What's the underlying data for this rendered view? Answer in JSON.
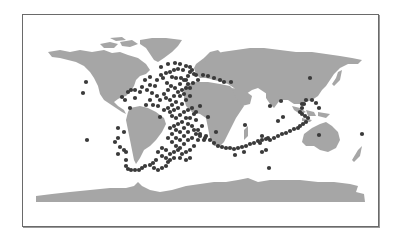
{
  "map": {
    "projection": "equirectangular",
    "colors": {
      "land": "#a6a6a6",
      "dot": "#3a3a3a",
      "frame": "#6a6a6a",
      "background": "#ffffff"
    },
    "marker": {
      "shape": "circle",
      "radius": 2.1
    },
    "points": [
      [
        86,
        82
      ],
      [
        83,
        93
      ],
      [
        87,
        140
      ],
      [
        150,
        77
      ],
      [
        161,
        67
      ],
      [
        168,
        64
      ],
      [
        175,
        63
      ],
      [
        180,
        64
      ],
      [
        183,
        70
      ],
      [
        192,
        70
      ],
      [
        196,
        75
      ],
      [
        198,
        80
      ],
      [
        145,
        80
      ],
      [
        150,
        85
      ],
      [
        155,
        86
      ],
      [
        157,
        80
      ],
      [
        161,
        75
      ],
      [
        166,
        73
      ],
      [
        170,
        72
      ],
      [
        174,
        70
      ],
      [
        178,
        69
      ],
      [
        186,
        66
      ],
      [
        190,
        67
      ],
      [
        194,
        74
      ],
      [
        163,
        78
      ],
      [
        167,
        83
      ],
      [
        171,
        86
      ],
      [
        175,
        88
      ],
      [
        180,
        84
      ],
      [
        184,
        80
      ],
      [
        188,
        76
      ],
      [
        190,
        72
      ],
      [
        186,
        80
      ],
      [
        181,
        78
      ],
      [
        176,
        78
      ],
      [
        172,
        77
      ],
      [
        168,
        90
      ],
      [
        164,
        94
      ],
      [
        166,
        98
      ],
      [
        170,
        100
      ],
      [
        174,
        96
      ],
      [
        178,
        92
      ],
      [
        182,
        90
      ],
      [
        186,
        88
      ],
      [
        188,
        84
      ],
      [
        180,
        96
      ],
      [
        176,
        102
      ],
      [
        172,
        105
      ],
      [
        168,
        108
      ],
      [
        170,
        112
      ],
      [
        174,
        110
      ],
      [
        178,
        108
      ],
      [
        182,
        104
      ],
      [
        186,
        100
      ],
      [
        190,
        96
      ],
      [
        184,
        94
      ],
      [
        190,
        88
      ],
      [
        193,
        83
      ],
      [
        172,
        116
      ],
      [
        176,
        118
      ],
      [
        180,
        115
      ],
      [
        184,
        112
      ],
      [
        188,
        110
      ],
      [
        192,
        108
      ],
      [
        186,
        118
      ],
      [
        182,
        122
      ],
      [
        178,
        124
      ],
      [
        174,
        126
      ],
      [
        170,
        128
      ],
      [
        176,
        130
      ],
      [
        180,
        132
      ],
      [
        184,
        128
      ],
      [
        188,
        124
      ],
      [
        190,
        118
      ],
      [
        194,
        114
      ],
      [
        196,
        120
      ],
      [
        192,
        126
      ],
      [
        188,
        132
      ],
      [
        184,
        136
      ],
      [
        180,
        140
      ],
      [
        176,
        138
      ],
      [
        172,
        134
      ],
      [
        168,
        138
      ],
      [
        172,
        142
      ],
      [
        176,
        146
      ],
      [
        180,
        148
      ],
      [
        184,
        144
      ],
      [
        188,
        140
      ],
      [
        192,
        138
      ],
      [
        196,
        134
      ],
      [
        198,
        140
      ],
      [
        194,
        146
      ],
      [
        190,
        150
      ],
      [
        186,
        152
      ],
      [
        182,
        154
      ],
      [
        178,
        150
      ],
      [
        174,
        152
      ],
      [
        170,
        154
      ],
      [
        166,
        150
      ],
      [
        162,
        148
      ],
      [
        158,
        152
      ],
      [
        162,
        156
      ],
      [
        166,
        158
      ],
      [
        170,
        160
      ],
      [
        174,
        158
      ],
      [
        168,
        162
      ],
      [
        166,
        166
      ],
      [
        162,
        168
      ],
      [
        158,
        170
      ],
      [
        154,
        168
      ],
      [
        190,
        158
      ],
      [
        186,
        160
      ],
      [
        180,
        158
      ],
      [
        194,
        130
      ],
      [
        198,
        130
      ],
      [
        200,
        134
      ],
      [
        204,
        140
      ],
      [
        206,
        136
      ],
      [
        202,
        126
      ],
      [
        196,
        112
      ],
      [
        200,
        106
      ],
      [
        128,
        92
      ],
      [
        131,
        90
      ],
      [
        135,
        90
      ],
      [
        140,
        92
      ],
      [
        142,
        87
      ],
      [
        147,
        90
      ],
      [
        152,
        93
      ],
      [
        157,
        96
      ],
      [
        160,
        100
      ],
      [
        150,
        100
      ],
      [
        153,
        105
      ],
      [
        146,
        105
      ],
      [
        135,
        98
      ],
      [
        125,
        100
      ],
      [
        122,
        97
      ],
      [
        130,
        108
      ],
      [
        164,
        110
      ],
      [
        158,
        106
      ],
      [
        160,
        117
      ],
      [
        118,
        128
      ],
      [
        124,
        132
      ],
      [
        118,
        138
      ],
      [
        115,
        142
      ],
      [
        120,
        147
      ],
      [
        124,
        150
      ],
      [
        118,
        154
      ],
      [
        126,
        152
      ],
      [
        126,
        160
      ],
      [
        126,
        166
      ],
      [
        128,
        169
      ],
      [
        131,
        170
      ],
      [
        135,
        170
      ],
      [
        139,
        170
      ],
      [
        142,
        168
      ],
      [
        145,
        166
      ],
      [
        150,
        165
      ],
      [
        153,
        163
      ],
      [
        156,
        160
      ],
      [
        200,
        136
      ],
      [
        205,
        138
      ],
      [
        210,
        140
      ],
      [
        214,
        143
      ],
      [
        218,
        146
      ],
      [
        222,
        147
      ],
      [
        226,
        148
      ],
      [
        230,
        148
      ],
      [
        234,
        149
      ],
      [
        238,
        148
      ],
      [
        242,
        147
      ],
      [
        246,
        146
      ],
      [
        250,
        144
      ],
      [
        254,
        143
      ],
      [
        258,
        141
      ],
      [
        262,
        140
      ],
      [
        266,
        139
      ],
      [
        270,
        140
      ],
      [
        274,
        138
      ],
      [
        278,
        136
      ],
      [
        282,
        134
      ],
      [
        286,
        133
      ],
      [
        290,
        131
      ],
      [
        294,
        129
      ],
      [
        298,
        128
      ],
      [
        300,
        126
      ],
      [
        303,
        124
      ],
      [
        306,
        122
      ],
      [
        308,
        118
      ],
      [
        305,
        116
      ],
      [
        302,
        114
      ],
      [
        300,
        112
      ],
      [
        302,
        108
      ],
      [
        304,
        104
      ],
      [
        306,
        100
      ],
      [
        283,
        117
      ],
      [
        278,
        121
      ],
      [
        268,
        138
      ],
      [
        262,
        136
      ],
      [
        260,
        143
      ],
      [
        262,
        152
      ],
      [
        266,
        150
      ],
      [
        244,
        152
      ],
      [
        235,
        155
      ],
      [
        208,
        117
      ],
      [
        216,
        132
      ],
      [
        245,
        125
      ],
      [
        270,
        106
      ],
      [
        281,
        101
      ],
      [
        302,
        104
      ],
      [
        310,
        78
      ],
      [
        312,
        100
      ],
      [
        316,
        103
      ],
      [
        319,
        108
      ],
      [
        319,
        135
      ],
      [
        269,
        168
      ],
      [
        362,
        134
      ],
      [
        231,
        82
      ],
      [
        203,
        75
      ],
      [
        208,
        76
      ],
      [
        214,
        78
      ],
      [
        220,
        80
      ],
      [
        224,
        82
      ]
    ]
  }
}
